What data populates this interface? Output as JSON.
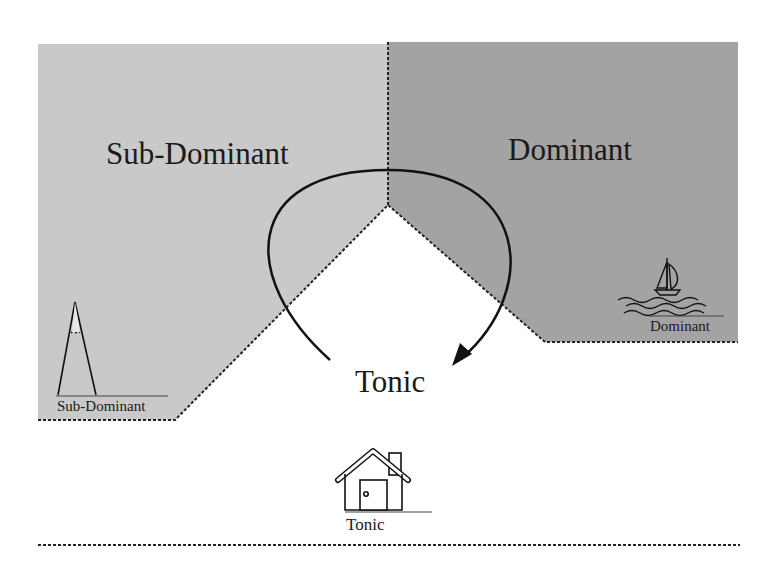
{
  "diagram": {
    "regions": {
      "subdominant": {
        "label": "Sub-Dominant",
        "fill": "#c9c9c9"
      },
      "dominant": {
        "label": "Dominant",
        "fill": "#a3a3a3"
      },
      "tonic": {
        "label": "Tonic",
        "fill": "#ffffff"
      }
    },
    "icons": {
      "mountain": {
        "caption": "Sub-Dominant"
      },
      "sailboat": {
        "caption": "Dominant"
      },
      "house": {
        "caption": "Tonic"
      }
    },
    "arrow": {
      "from": "Tonic",
      "via": [
        "Sub-Dominant",
        "Dominant"
      ],
      "to": "Tonic",
      "stroke": "#111111"
    },
    "border": {
      "style": "dashed",
      "color": "#222222"
    }
  }
}
